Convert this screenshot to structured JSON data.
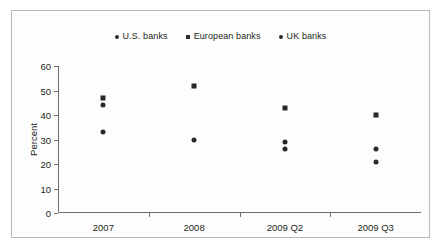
{
  "chart_data": {
    "type": "scatter",
    "title": "",
    "xlabel": "",
    "ylabel": "Percent",
    "categories": [
      "2007",
      "2008",
      "2009 Q2",
      "2009 Q3"
    ],
    "ylim": [
      0,
      60
    ],
    "yticks": [
      0,
      10,
      20,
      30,
      40,
      50,
      60
    ],
    "grid": false,
    "legend_position": "top-center",
    "series": [
      {
        "name": "U.S. banks",
        "marker": "circle",
        "color": "#2b2829",
        "values": [
          44,
          null,
          29,
          26
        ]
      },
      {
        "name": "European banks",
        "marker": "square",
        "color": "#2b2829",
        "values": [
          47,
          52,
          43,
          40
        ]
      },
      {
        "name": "UK banks",
        "marker": "circle",
        "color": "#2b2829",
        "values": [
          33,
          30,
          26,
          21
        ]
      }
    ],
    "points": [
      {
        "category": "2007",
        "series": "European banks",
        "marker": "square",
        "value": 47
      },
      {
        "category": "2007",
        "series": "U.S. banks",
        "marker": "circle",
        "value": 44
      },
      {
        "category": "2007",
        "series": "UK banks",
        "marker": "circle",
        "value": 33
      },
      {
        "category": "2008",
        "series": "European banks",
        "marker": "square",
        "value": 52
      },
      {
        "category": "2008",
        "series": "UK banks",
        "marker": "circle",
        "value": 30
      },
      {
        "category": "2009 Q2",
        "series": "European banks",
        "marker": "square",
        "value": 43
      },
      {
        "category": "2009 Q2",
        "series": "U.S. banks",
        "marker": "circle",
        "value": 29
      },
      {
        "category": "2009 Q2",
        "series": "UK banks",
        "marker": "circle",
        "value": 26
      },
      {
        "category": "2009 Q3",
        "series": "European banks",
        "marker": "square",
        "value": 40
      },
      {
        "category": "2009 Q3",
        "series": "U.S. banks",
        "marker": "circle",
        "value": 26
      },
      {
        "category": "2009 Q3",
        "series": "UK banks",
        "marker": "circle",
        "value": 21
      }
    ]
  },
  "legend": {
    "items": [
      {
        "label": "U.S. banks",
        "marker": "circle"
      },
      {
        "label": "European banks",
        "marker": "square"
      },
      {
        "label": "UK banks",
        "marker": "circle"
      }
    ]
  },
  "colors": {
    "marker": "#2b2829",
    "axis": "#6f6f6f",
    "border": "#b9b9b9",
    "text": "#231f20",
    "background": "#ffffff"
  }
}
